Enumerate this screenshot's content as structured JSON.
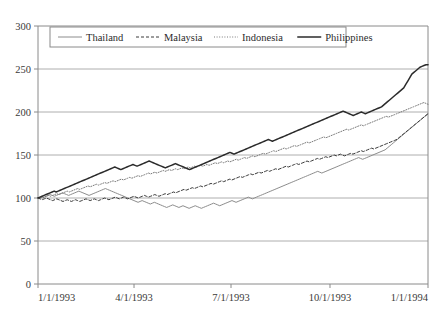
{
  "chart_data": {
    "type": "line",
    "title": "",
    "subtitle": "",
    "xlabel": "",
    "ylabel": "",
    "ylim": [
      0,
      300
    ],
    "ytick_values": [
      0,
      50,
      100,
      150,
      200,
      250,
      300
    ],
    "ytick_labels": [
      "0",
      "50",
      "100",
      "150",
      "200",
      "250",
      "300"
    ],
    "xtick_labels": [
      "1/1/1993",
      "4/1/1993",
      "7/1/1993",
      "10/1/1993",
      "1/1/1994"
    ],
    "xtick_positions": [
      0,
      0.2462,
      0.4949,
      0.7487,
      1.0
    ],
    "grid": "horizontal",
    "legend_position": "top-inside",
    "legend_entries": [
      "Thailand",
      "Malaysia",
      "Indonesia",
      "Philippines"
    ],
    "series": [
      {
        "name": "Thailand",
        "style": "solid-thin",
        "color": "#8c8c8c",
        "values": [
          100,
          100,
          101,
          101,
          102,
          103,
          104,
          103,
          102,
          103,
          104,
          105,
          106,
          105,
          104,
          103,
          104,
          105,
          106,
          107,
          108,
          107,
          106,
          105,
          104,
          103,
          104,
          105,
          106,
          107,
          108,
          109,
          110,
          111,
          110,
          109,
          108,
          107,
          106,
          105,
          104,
          103,
          102,
          101,
          100,
          99,
          98,
          97,
          96,
          95,
          96,
          97,
          96,
          95,
          94,
          93,
          94,
          95,
          94,
          93,
          92,
          91,
          90,
          89,
          90,
          91,
          92,
          91,
          90,
          89,
          90,
          91,
          90,
          89,
          88,
          89,
          90,
          91,
          90,
          89,
          88,
          89,
          90,
          91,
          92,
          93,
          94,
          93,
          92,
          91,
          92,
          93,
          94,
          95,
          96,
          97,
          96,
          95,
          96,
          97,
          98,
          99,
          100,
          101,
          100,
          99,
          100,
          101,
          102,
          103,
          104,
          105,
          106,
          107,
          108,
          109,
          110,
          111,
          112,
          113,
          114,
          115,
          116,
          117,
          118,
          119,
          120,
          121,
          122,
          123,
          124,
          125,
          126,
          127,
          128,
          129,
          130,
          131,
          130,
          129,
          130,
          131,
          132,
          133,
          134,
          135,
          136,
          137,
          138,
          139,
          140,
          141,
          142,
          143,
          144,
          145,
          146,
          147,
          146,
          145,
          146,
          147,
          148,
          149,
          150,
          151,
          152,
          153,
          154,
          155,
          156,
          158,
          160,
          162,
          164,
          166,
          168,
          170,
          172,
          174,
          176,
          178,
          180,
          182,
          184,
          186,
          188,
          190,
          192,
          194,
          196,
          198
        ]
      },
      {
        "name": "Malaysia",
        "style": "dashed",
        "color": "#3a3a3a",
        "values": [
          100,
          99,
          98,
          99,
          100,
          99,
          98,
          97,
          98,
          99,
          98,
          97,
          96,
          97,
          98,
          97,
          96,
          97,
          98,
          97,
          96,
          97,
          98,
          99,
          98,
          97,
          98,
          99,
          98,
          97,
          98,
          99,
          100,
          99,
          98,
          99,
          100,
          101,
          100,
          99,
          100,
          101,
          100,
          99,
          100,
          101,
          102,
          101,
          100,
          101,
          102,
          103,
          102,
          101,
          102,
          103,
          104,
          103,
          102,
          103,
          104,
          105,
          104,
          105,
          106,
          107,
          106,
          107,
          108,
          109,
          110,
          109,
          110,
          111,
          112,
          111,
          112,
          113,
          114,
          113,
          114,
          115,
          116,
          117,
          116,
          117,
          118,
          119,
          120,
          119,
          120,
          121,
          122,
          121,
          122,
          123,
          124,
          125,
          124,
          125,
          126,
          127,
          128,
          127,
          128,
          129,
          130,
          129,
          130,
          131,
          132,
          131,
          132,
          133,
          134,
          133,
          134,
          135,
          136,
          137,
          136,
          137,
          138,
          139,
          140,
          139,
          140,
          141,
          142,
          143,
          142,
          143,
          144,
          145,
          146,
          145,
          146,
          147,
          148,
          147,
          148,
          149,
          150,
          149,
          150,
          151,
          150,
          149,
          150,
          151,
          152,
          151,
          152,
          153,
          154,
          155,
          154,
          155,
          156,
          157,
          158,
          157,
          158,
          159,
          160,
          161,
          162,
          163,
          164,
          165,
          166,
          167,
          168,
          170,
          172,
          174,
          176,
          178,
          180,
          182,
          184,
          186,
          188,
          190,
          192,
          194,
          196,
          198
        ]
      },
      {
        "name": "Indonesia",
        "style": "dotted",
        "color": "#7a7a7a",
        "values": [
          100,
          101,
          100,
          101,
          102,
          103,
          102,
          103,
          104,
          105,
          104,
          105,
          106,
          107,
          108,
          107,
          108,
          109,
          110,
          111,
          110,
          111,
          112,
          113,
          114,
          113,
          114,
          115,
          116,
          115,
          116,
          117,
          118,
          117,
          118,
          119,
          120,
          119,
          120,
          121,
          122,
          121,
          122,
          123,
          124,
          123,
          124,
          125,
          126,
          125,
          126,
          127,
          128,
          129,
          128,
          129,
          130,
          129,
          130,
          131,
          132,
          131,
          132,
          133,
          132,
          133,
          134,
          133,
          134,
          135,
          134,
          135,
          136,
          135,
          136,
          137,
          136,
          137,
          138,
          137,
          138,
          139,
          138,
          139,
          140,
          141,
          140,
          141,
          142,
          141,
          142,
          143,
          142,
          143,
          144,
          145,
          144,
          145,
          146,
          147,
          146,
          147,
          148,
          149,
          148,
          149,
          150,
          151,
          152,
          151,
          152,
          153,
          154,
          155,
          154,
          155,
          156,
          157,
          158,
          157,
          158,
          159,
          160,
          161,
          160,
          161,
          162,
          163,
          164,
          165,
          164,
          165,
          166,
          167,
          168,
          169,
          170,
          171,
          170,
          171,
          172,
          173,
          174,
          175,
          176,
          177,
          178,
          179,
          180,
          179,
          180,
          181,
          182,
          183,
          184,
          185,
          184,
          185,
          186,
          187,
          188,
          189,
          190,
          191,
          192,
          193,
          194,
          195,
          194,
          195,
          196,
          197,
          198,
          199,
          200,
          201,
          202,
          203,
          204,
          205,
          206,
          207,
          208,
          209,
          210,
          211,
          210,
          209
        ]
      },
      {
        "name": "Philippines",
        "style": "solid-thick",
        "color": "#2b2b2b",
        "values": [
          100,
          101,
          102,
          103,
          104,
          105,
          106,
          107,
          108,
          107,
          108,
          109,
          110,
          111,
          112,
          113,
          114,
          115,
          116,
          117,
          118,
          119,
          120,
          121,
          122,
          123,
          124,
          125,
          126,
          127,
          128,
          129,
          130,
          131,
          132,
          133,
          134,
          135,
          136,
          135,
          134,
          133,
          134,
          135,
          136,
          137,
          138,
          139,
          138,
          137,
          138,
          139,
          140,
          141,
          142,
          143,
          142,
          141,
          140,
          139,
          138,
          137,
          136,
          135,
          136,
          137,
          138,
          139,
          140,
          139,
          138,
          137,
          136,
          135,
          134,
          133,
          134,
          135,
          136,
          137,
          138,
          139,
          140,
          141,
          142,
          143,
          144,
          145,
          146,
          147,
          148,
          149,
          150,
          151,
          152,
          153,
          152,
          151,
          152,
          153,
          154,
          155,
          156,
          157,
          158,
          159,
          160,
          161,
          162,
          163,
          164,
          165,
          166,
          167,
          168,
          167,
          166,
          167,
          168,
          169,
          170,
          171,
          172,
          173,
          174,
          175,
          176,
          177,
          178,
          179,
          180,
          181,
          182,
          183,
          184,
          185,
          186,
          187,
          188,
          189,
          190,
          191,
          192,
          193,
          194,
          195,
          196,
          197,
          198,
          199,
          200,
          201,
          200,
          199,
          198,
          197,
          196,
          197,
          198,
          199,
          200,
          199,
          198,
          199,
          200,
          201,
          202,
          203,
          204,
          205,
          206,
          208,
          210,
          212,
          214,
          216,
          218,
          220,
          222,
          224,
          226,
          228,
          232,
          236,
          240,
          244,
          246,
          248,
          250,
          252,
          253,
          254,
          255,
          255
        ]
      }
    ]
  }
}
